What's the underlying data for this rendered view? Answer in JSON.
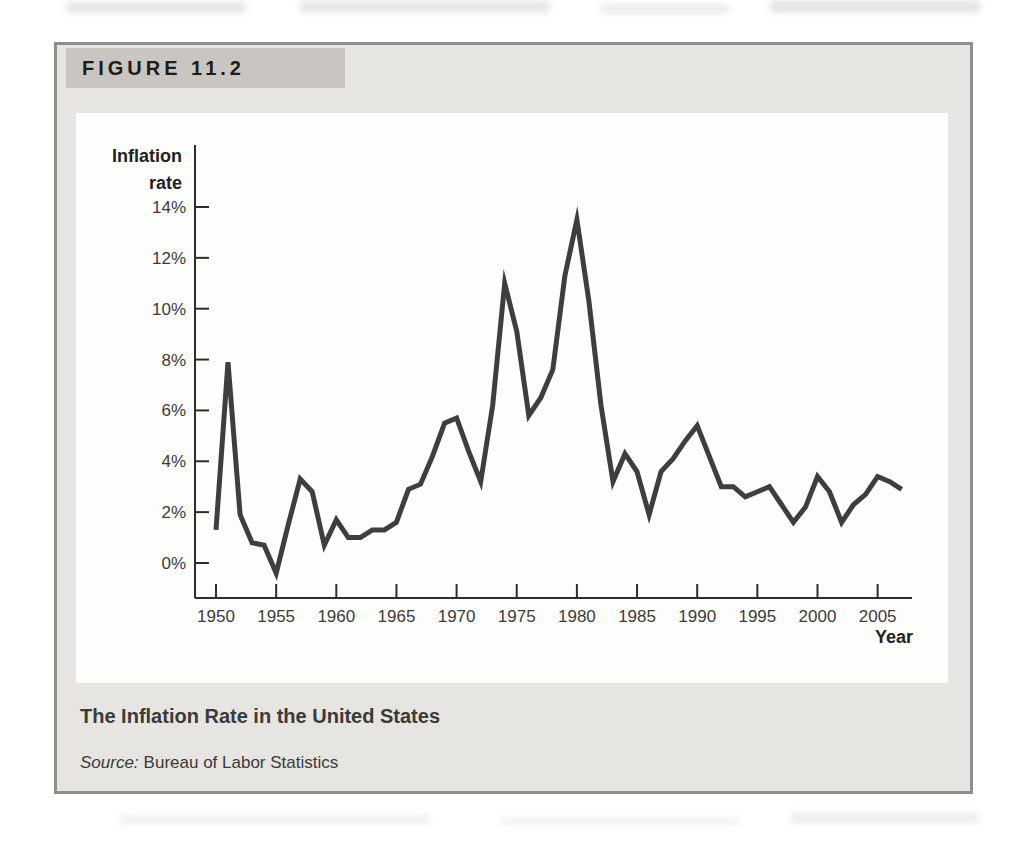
{
  "figure": {
    "label": "FIGURE 11.2",
    "caption_title": "The Inflation Rate in the United States",
    "source_prefix": "Source:",
    "source_text": "Bureau of Labor Statistics"
  },
  "colors": {
    "figure_background": "#e7e5e1",
    "header_box": "#c9c6c1",
    "panel_background": "#fdfdfc",
    "border": "#8e8e8a",
    "data_line": "#3e3e3e",
    "axis": "#2d2d2d",
    "label_text": "#222222",
    "caption_text": "#3a3a3a"
  },
  "chart_data": {
    "type": "line",
    "title": "The Inflation Rate in the United States",
    "source": "Bureau of Labor Statistics",
    "xlabel": "Year",
    "ylabel": "Inflation rate",
    "grid": false,
    "legend": false,
    "x_ticks": [
      1950,
      1955,
      1960,
      1965,
      1970,
      1975,
      1980,
      1985,
      1990,
      1995,
      2000,
      2005
    ],
    "y_ticks_percent": [
      0,
      2,
      4,
      6,
      8,
      10,
      12,
      14
    ],
    "y_tick_suffix": "%",
    "xlim": [
      1948.3,
      2007.9
    ],
    "ylim_percent": [
      -1.4,
      16.4
    ],
    "series": [
      {
        "name": "U.S. inflation rate (CPI, %)",
        "x": [
          1950,
          1951,
          1952,
          1953,
          1954,
          1955,
          1956,
          1957,
          1958,
          1959,
          1960,
          1961,
          1962,
          1963,
          1964,
          1965,
          1966,
          1967,
          1968,
          1969,
          1970,
          1971,
          1972,
          1973,
          1974,
          1975,
          1976,
          1977,
          1978,
          1979,
          1980,
          1981,
          1982,
          1983,
          1984,
          1985,
          1986,
          1987,
          1988,
          1989,
          1990,
          1991,
          1992,
          1993,
          1994,
          1995,
          1996,
          1997,
          1998,
          1999,
          2000,
          2001,
          2002,
          2003,
          2004,
          2005,
          2006,
          2007
        ],
        "y": [
          1.3,
          7.9,
          1.9,
          0.8,
          0.7,
          -0.4,
          1.5,
          3.3,
          2.8,
          0.7,
          1.7,
          1.0,
          1.0,
          1.3,
          1.3,
          1.6,
          2.9,
          3.1,
          4.2,
          5.5,
          5.7,
          4.4,
          3.2,
          6.2,
          11.0,
          9.1,
          5.8,
          6.5,
          7.6,
          11.3,
          13.5,
          10.3,
          6.2,
          3.2,
          4.3,
          3.6,
          1.9,
          3.6,
          4.1,
          4.8,
          5.4,
          4.2,
          3.0,
          3.0,
          2.6,
          2.8,
          3.0,
          2.3,
          1.6,
          2.2,
          3.4,
          2.8,
          1.6,
          2.3,
          2.7,
          3.4,
          3.2,
          2.9
        ]
      }
    ]
  }
}
